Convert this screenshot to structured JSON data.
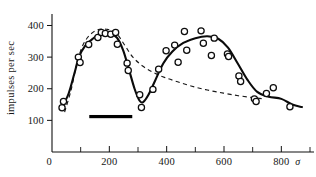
{
  "chart_data": {
    "type": "scatter",
    "title": "",
    "subtitle": "",
    "xlabel": "",
    "ylabel": "impulses per sec",
    "x_unit_symbol": "σ",
    "origin_label": "0",
    "xlim": [
      0,
      900
    ],
    "ylim": [
      0,
      430
    ],
    "grid": false,
    "legend": null,
    "x_major_ticks": [
      200,
      400,
      600,
      800
    ],
    "x_minor_ticks": [
      100,
      300,
      500,
      700,
      900
    ],
    "x_tick_labels": [
      "200",
      "400",
      "600",
      "800"
    ],
    "y_major_ticks": [
      100,
      200,
      300,
      400
    ],
    "y_tick_labels": [
      "100",
      "200",
      "300",
      "400"
    ],
    "points": [
      {
        "x": 35,
        "y": 140
      },
      {
        "x": 40,
        "y": 160
      },
      {
        "x": 92,
        "y": 300
      },
      {
        "x": 98,
        "y": 283
      },
      {
        "x": 128,
        "y": 340
      },
      {
        "x": 160,
        "y": 362
      },
      {
        "x": 172,
        "y": 378
      },
      {
        "x": 186,
        "y": 375
      },
      {
        "x": 205,
        "y": 372
      },
      {
        "x": 222,
        "y": 378
      },
      {
        "x": 228,
        "y": 341
      },
      {
        "x": 262,
        "y": 281
      },
      {
        "x": 266,
        "y": 258
      },
      {
        "x": 306,
        "y": 181
      },
      {
        "x": 312,
        "y": 141
      },
      {
        "x": 352,
        "y": 198
      },
      {
        "x": 372,
        "y": 262
      },
      {
        "x": 398,
        "y": 320
      },
      {
        "x": 428,
        "y": 338
      },
      {
        "x": 440,
        "y": 284
      },
      {
        "x": 462,
        "y": 381
      },
      {
        "x": 470,
        "y": 322
      },
      {
        "x": 520,
        "y": 383
      },
      {
        "x": 528,
        "y": 344
      },
      {
        "x": 556,
        "y": 305
      },
      {
        "x": 566,
        "y": 360
      },
      {
        "x": 612,
        "y": 310
      },
      {
        "x": 616,
        "y": 302
      },
      {
        "x": 652,
        "y": 240
      },
      {
        "x": 658,
        "y": 223
      },
      {
        "x": 706,
        "y": 168
      },
      {
        "x": 712,
        "y": 160
      },
      {
        "x": 748,
        "y": 185
      },
      {
        "x": 772,
        "y": 203
      },
      {
        "x": 830,
        "y": 143
      }
    ],
    "solid_curve": [
      {
        "x": 34,
        "y": 139
      },
      {
        "x": 58,
        "y": 185
      },
      {
        "x": 78,
        "y": 248
      },
      {
        "x": 94,
        "y": 300
      },
      {
        "x": 116,
        "y": 336
      },
      {
        "x": 142,
        "y": 358
      },
      {
        "x": 172,
        "y": 375
      },
      {
        "x": 200,
        "y": 374
      },
      {
        "x": 226,
        "y": 362
      },
      {
        "x": 248,
        "y": 322
      },
      {
        "x": 268,
        "y": 262
      },
      {
        "x": 288,
        "y": 200
      },
      {
        "x": 305,
        "y": 163
      },
      {
        "x": 318,
        "y": 158
      },
      {
        "x": 336,
        "y": 180
      },
      {
        "x": 360,
        "y": 226
      },
      {
        "x": 388,
        "y": 280
      },
      {
        "x": 420,
        "y": 318
      },
      {
        "x": 458,
        "y": 345
      },
      {
        "x": 500,
        "y": 360
      },
      {
        "x": 542,
        "y": 366
      },
      {
        "x": 580,
        "y": 358
      },
      {
        "x": 614,
        "y": 330
      },
      {
        "x": 648,
        "y": 280
      },
      {
        "x": 682,
        "y": 228
      },
      {
        "x": 716,
        "y": 190
      },
      {
        "x": 756,
        "y": 175
      },
      {
        "x": 800,
        "y": 168
      },
      {
        "x": 838,
        "y": 150
      },
      {
        "x": 872,
        "y": 142
      }
    ],
    "dashed_curve": [
      {
        "x": 44,
        "y": 126
      },
      {
        "x": 66,
        "y": 194
      },
      {
        "x": 84,
        "y": 268
      },
      {
        "x": 104,
        "y": 330
      },
      {
        "x": 128,
        "y": 366
      },
      {
        "x": 158,
        "y": 386
      },
      {
        "x": 190,
        "y": 388
      },
      {
        "x": 222,
        "y": 378
      },
      {
        "x": 252,
        "y": 340
      },
      {
        "x": 282,
        "y": 300
      },
      {
        "x": 316,
        "y": 272
      },
      {
        "x": 352,
        "y": 252
      },
      {
        "x": 392,
        "y": 236
      },
      {
        "x": 438,
        "y": 222
      },
      {
        "x": 488,
        "y": 208
      },
      {
        "x": 542,
        "y": 196
      },
      {
        "x": 598,
        "y": 186
      },
      {
        "x": 650,
        "y": 178
      },
      {
        "x": 700,
        "y": 172
      },
      {
        "x": 740,
        "y": 168
      }
    ],
    "stimulus_bar": {
      "x_start": 130,
      "x_end": 280,
      "y": 112,
      "label": ""
    },
    "annotations": []
  }
}
